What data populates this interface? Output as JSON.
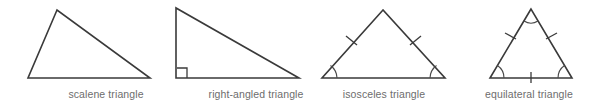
{
  "figure": {
    "background_color": "#ffffff",
    "stroke_color": "#3a3a3a",
    "label_color": "#6d6d6d"
  },
  "triangles": [
    {
      "id": "scalene",
      "label": "scalene triangle",
      "vertices": [
        [
          57,
          10
        ],
        [
          28,
          78
        ],
        [
          150,
          78
        ]
      ],
      "markings": {
        "equal_side_ticks": 0,
        "equal_angle_arcs": 0,
        "right_angle_marker": false
      }
    },
    {
      "id": "right-angled",
      "label": "right-angled triangle",
      "vertices": [
        [
          176,
          8
        ],
        [
          176,
          78
        ],
        [
          299,
          78
        ]
      ],
      "markings": {
        "equal_side_ticks": 0,
        "equal_angle_arcs": 0,
        "right_angle_marker": true
      }
    },
    {
      "id": "isosceles",
      "label": "isosceles triangle",
      "vertices": [
        [
          383,
          10
        ],
        [
          322,
          78
        ],
        [
          445,
          78
        ]
      ],
      "markings": {
        "equal_side_ticks": 2,
        "equal_angle_arcs": 2,
        "right_angle_marker": false
      }
    },
    {
      "id": "equilateral",
      "label": "equilateral triangle",
      "vertices": [
        [
          531,
          9
        ],
        [
          490,
          78
        ],
        [
          572,
          78
        ]
      ],
      "markings": {
        "equal_side_ticks": 3,
        "equal_angle_arcs": 3,
        "right_angle_marker": false
      }
    }
  ]
}
